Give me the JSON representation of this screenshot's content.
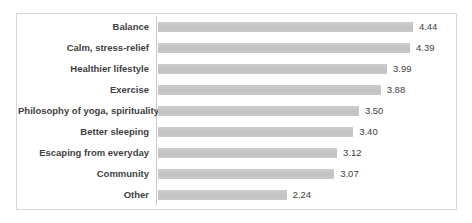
{
  "chart_data": {
    "type": "bar",
    "orientation": "horizontal",
    "title": "",
    "xlabel": "",
    "ylabel": "",
    "categories": [
      "Balance",
      "Calm, stress-relief",
      "Healthier lifestyle",
      "Exercise",
      "Philosophy of yoga, spirituality",
      "Better sleeping",
      "Escaping from everyday",
      "Community",
      "Other"
    ],
    "values": [
      4.44,
      4.39,
      3.99,
      3.88,
      3.5,
      3.4,
      3.12,
      3.07,
      2.24
    ],
    "value_labels": [
      "4.44",
      "4.39",
      "3.99",
      "3.88",
      "3.50",
      "3.40",
      "3.12",
      "3.07",
      "2.24"
    ],
    "xlim": [
      0,
      5
    ],
    "grid": false,
    "legend": false,
    "data_labels_shown": true,
    "colors": {
      "bar_fill": "#c6c6c6",
      "category_text": "#3f3f3f",
      "value_text": "#404040",
      "axis_line": "#c9c9c9",
      "frame_border": "#d6d6d6",
      "background": "#ffffff"
    }
  }
}
